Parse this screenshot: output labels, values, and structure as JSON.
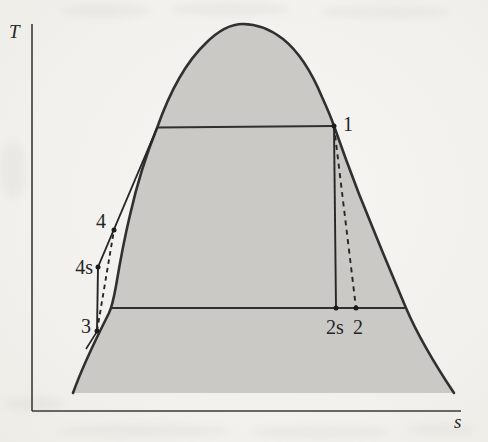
{
  "figure": {
    "kind": "temperature-entropy-diagram",
    "axes": {
      "y_label": "T",
      "x_label": "s"
    },
    "points": {
      "p1": {
        "label": "1"
      },
      "p2": {
        "label": "2"
      },
      "p2s": {
        "label": "2s"
      },
      "p3": {
        "label": "3"
      },
      "p4": {
        "label": "4"
      },
      "p4s": {
        "label": "4s"
      }
    },
    "curves": {
      "saturation_dome": "vapor dome, shaded",
      "upper_isotherm": "horizontal line at high temperature from saturated-liquid line to point 1",
      "lower_isotherm": "horizontal line at low temperature across dome through 2s and 2"
    },
    "processes": [
      {
        "from": "1",
        "to": "2s",
        "style": "solid"
      },
      {
        "from": "1",
        "to": "2",
        "style": "dashed"
      },
      {
        "from": "3",
        "to": "4s",
        "style": "solid"
      },
      {
        "from": "3",
        "to": "4",
        "style": "dashed"
      },
      {
        "from": "4s",
        "to": "saturation-line",
        "style": "solid",
        "note": "passes through 4"
      }
    ],
    "colors": {
      "line": "#303030",
      "dome_fill": "#cac9c6",
      "paper": "#f2f1ed",
      "text": "#262626"
    }
  }
}
